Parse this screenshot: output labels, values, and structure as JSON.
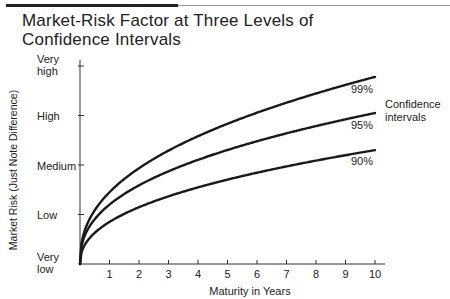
{
  "chart_data": {
    "type": "line",
    "title": "Market-Risk Factor at Three Levels of Confidence Intervals",
    "title_lines": [
      "Market-Risk Factor at Three Levels of",
      "Confidence Intervals"
    ],
    "xlabel": "Maturity in Years",
    "ylabel": "Market Risk (Just Note Difference)",
    "x_ticks": [
      "1",
      "2",
      "3",
      "4",
      "5",
      "6",
      "7",
      "8",
      "9",
      "10"
    ],
    "y_ticks": [
      "Very low",
      "Low",
      "Medium",
      "High",
      "Very high"
    ],
    "y_tick_lines": [
      [
        "Very",
        "low"
      ],
      [
        "Low"
      ],
      [
        "Medium"
      ],
      [
        "High"
      ],
      [
        "Very",
        "high"
      ]
    ],
    "xlim": [
      0,
      10
    ],
    "ylim": [
      0,
      4
    ],
    "y_scale_note": "0=Very low, 1=Low, 2=Medium, 3=High, 4=Very high",
    "x": [
      0,
      1,
      2,
      3,
      4,
      5,
      6,
      7,
      8,
      9,
      10
    ],
    "series": [
      {
        "name": "99%",
        "values": [
          0,
          1.45,
          2.0,
          2.4,
          2.7,
          2.95,
          3.15,
          3.33,
          3.5,
          3.65,
          3.78
        ]
      },
      {
        "name": "95%",
        "values": [
          0,
          1.2,
          1.65,
          1.97,
          2.2,
          2.4,
          2.57,
          2.72,
          2.85,
          2.96,
          3.05
        ]
      },
      {
        "name": "90%",
        "values": [
          0,
          0.85,
          1.18,
          1.42,
          1.6,
          1.76,
          1.9,
          2.02,
          2.13,
          2.22,
          2.3
        ]
      }
    ],
    "annotations": [
      "99%",
      "95%",
      "90%",
      "Confidence intervals"
    ],
    "legend_text": [
      "Confidence",
      "intervals"
    ],
    "grid": false
  }
}
